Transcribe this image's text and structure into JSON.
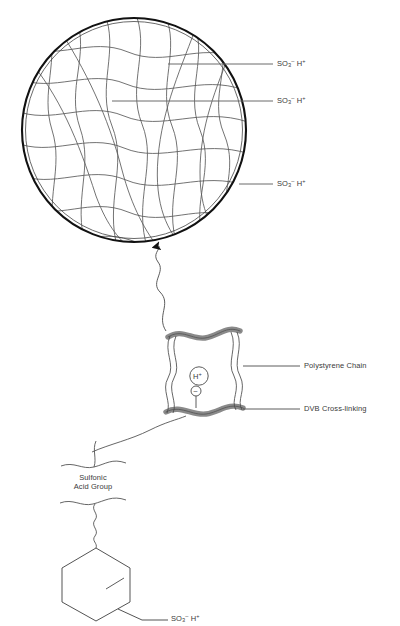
{
  "diagram": {
    "sphere_labels": [
      {
        "id": "so3h-top",
        "text": "SO₃⁻ H⁺",
        "base": "SO",
        "sub": "3",
        "supminus": "–",
        "sup2": "+",
        "h": "H"
      },
      {
        "id": "so3h-middle",
        "text": "SO₃⁻ H⁺",
        "base": "SO",
        "sub": "3",
        "supminus": "–",
        "sup2": "+",
        "h": "H"
      },
      {
        "id": "so3h-bottom",
        "text": "SO₃⁻ H⁺",
        "base": "SO",
        "sub": "3",
        "supminus": "–",
        "sup2": "+",
        "h": "H"
      }
    ],
    "mesh_labels": {
      "polystyrene": "Polystyrene Chain",
      "dvb": "DVB Cross-linking",
      "proton": "H",
      "proton_charge": "+",
      "anion_charge": "–"
    },
    "monomer": {
      "group_line1": "Sulfonic",
      "group_line2": "Acid Group",
      "so3h_base": "SO",
      "so3h_sub": "3",
      "so3h_supminus": "–",
      "so3h_h": "H",
      "so3h_sup": "+"
    },
    "footer_caption": ""
  },
  "colors": {
    "ink": "#3a3a3a",
    "outline": "#1a1a1a",
    "band_fill": "#8a8a8a",
    "band_stroke": "#444444",
    "leader": "#6a6a6a",
    "mesh": "#5a5a5a",
    "background": "#ffffff"
  }
}
